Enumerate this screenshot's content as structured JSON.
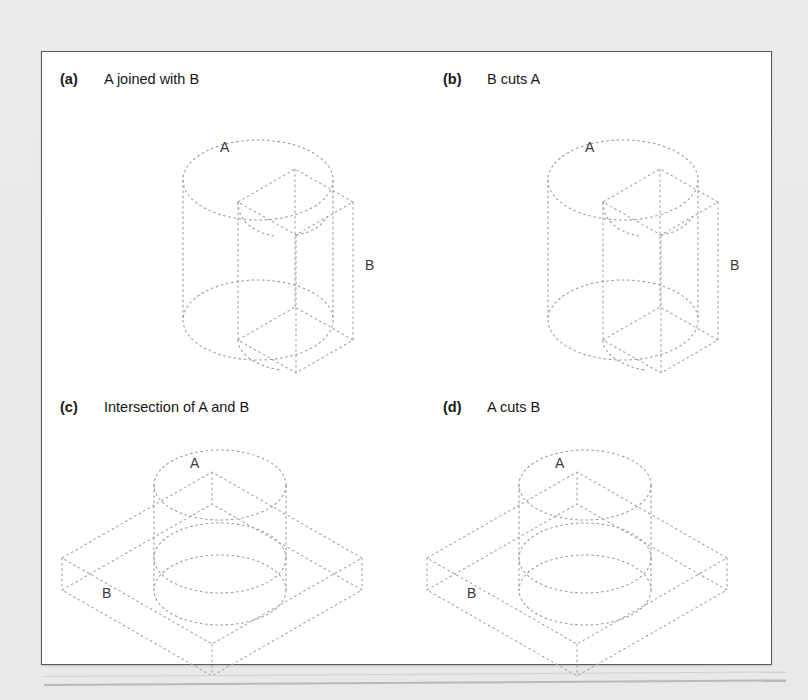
{
  "document": {
    "background_color": "#ebebeb",
    "panel_color": "#ffffff",
    "line_color": "#9a9a9a",
    "text_color": "#17171a"
  },
  "figure": {
    "panels": [
      {
        "tag": "(a)",
        "caption": "A joined with B",
        "solid_a_label": "A",
        "solid_b_label": "B",
        "arrangement": "cylinder-vertical-with-vertical-slab"
      },
      {
        "tag": "(b)",
        "caption": "B cuts A",
        "solid_a_label": "A",
        "solid_b_label": "B",
        "arrangement": "cylinder-vertical-with-vertical-slab"
      },
      {
        "tag": "(c)",
        "caption": "Intersection of A and B",
        "solid_a_label": "A",
        "solid_b_label": "B",
        "arrangement": "cylinder-vertical-with-horizontal-slab"
      },
      {
        "tag": "(d)",
        "caption": "A cuts B",
        "solid_a_label": "A",
        "solid_b_label": "B",
        "arrangement": "cylinder-vertical-with-horizontal-slab"
      }
    ]
  }
}
